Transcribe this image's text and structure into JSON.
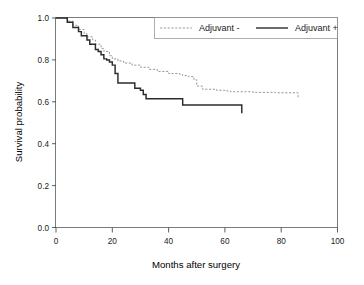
{
  "chart_data": {
    "type": "line",
    "title": "",
    "xlabel": "Months after surgery",
    "ylabel": "Survival probability",
    "xlim": [
      0,
      100
    ],
    "ylim": [
      0.0,
      1.0
    ],
    "xticks": [
      "0",
      "20",
      "40",
      "60",
      "80",
      "100"
    ],
    "xtick_values": [
      0,
      20,
      40,
      60,
      80,
      100
    ],
    "yticks": [
      "0.0",
      "0.2",
      "0.4",
      "0.6",
      "0.8",
      "1.0"
    ],
    "ytick_values": [
      0.0,
      0.2,
      0.4,
      0.6,
      0.8,
      1.0
    ],
    "grid": false,
    "legend_position": "top",
    "plot_style": "kaplan-meier step function",
    "series": [
      {
        "name": "Adjuvant -",
        "line_style": "dashed",
        "color": "#9a9a9a",
        "x": [
          0,
          2,
          4,
          6,
          8,
          10,
          11,
          13,
          14,
          16,
          17,
          19,
          20,
          22,
          24,
          27,
          30,
          33,
          36,
          40,
          44,
          45,
          47,
          49,
          50,
          52,
          57,
          60,
          62,
          70,
          78,
          85,
          86
        ],
        "y": [
          1.0,
          1.0,
          0.985,
          0.965,
          0.945,
          0.925,
          0.91,
          0.895,
          0.875,
          0.855,
          0.84,
          0.82,
          0.805,
          0.795,
          0.785,
          0.775,
          0.765,
          0.755,
          0.745,
          0.735,
          0.73,
          0.725,
          0.72,
          0.705,
          0.675,
          0.66,
          0.655,
          0.652,
          0.648,
          0.645,
          0.643,
          0.643,
          0.615
        ]
      },
      {
        "name": "Adjuvant +",
        "line_style": "solid",
        "color": "#2b2b2b",
        "x": [
          0,
          2,
          4,
          6,
          8,
          9,
          11,
          12,
          14,
          15,
          16,
          17,
          18,
          19,
          20,
          21,
          22,
          27,
          28,
          30,
          31,
          32,
          44,
          45,
          50,
          58,
          64,
          65,
          66
        ],
        "y": [
          1.0,
          1.0,
          0.98,
          0.955,
          0.935,
          0.915,
          0.895,
          0.875,
          0.85,
          0.84,
          0.825,
          0.805,
          0.8,
          0.79,
          0.775,
          0.735,
          0.69,
          0.69,
          0.665,
          0.655,
          0.635,
          0.615,
          0.615,
          0.585,
          0.585,
          0.585,
          0.585,
          0.585,
          0.545
        ]
      }
    ],
    "annotations": []
  },
  "legend": {
    "entries": [
      {
        "label": "Adjuvant -",
        "style": "dashed"
      },
      {
        "label": "Adjuvant +",
        "style": "solid"
      }
    ]
  },
  "axes": {
    "x_title": "Months after surgery",
    "y_title": "Survival probability"
  }
}
